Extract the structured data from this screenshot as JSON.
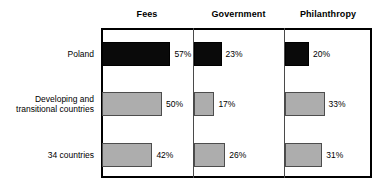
{
  "chart_data": {
    "type": "bar",
    "title": "",
    "subtitle": "",
    "xlabel": "",
    "ylabel": "",
    "orientation": "horizontal",
    "grid": false,
    "legend": "none",
    "panel_layout": "three side-by-side panels sharing row categories",
    "value_suffix": "%",
    "xlim": [
      0,
      60
    ],
    "panels": [
      "Fees",
      "Government",
      "Philanthropy"
    ],
    "categories": [
      "Poland",
      "Developing and transitional countries",
      "34 countries"
    ],
    "series": [
      {
        "name": "Fees",
        "values": [
          57,
          50,
          42
        ]
      },
      {
        "name": "Government",
        "values": [
          23,
          17,
          26
        ]
      },
      {
        "name": "Philanthropy",
        "values": [
          20,
          33,
          31
        ]
      }
    ],
    "bar_colors": {
      "Poland": "#0a0a0a",
      "Developing and transitional countries": "#adadad",
      "34 countries": "#adadad"
    }
  },
  "headers": [
    {
      "label": "Fees"
    },
    {
      "label": "Government"
    },
    {
      "label": "Philanthropy"
    }
  ],
  "rows": [
    {
      "label": "Poland"
    },
    {
      "label": "Developing and\ntransitional countries"
    },
    {
      "label": "34 countries"
    }
  ],
  "cells": {
    "fees": [
      {
        "value_label": "57%"
      },
      {
        "value_label": "50%"
      },
      {
        "value_label": "42%"
      }
    ],
    "government": [
      {
        "value_label": "23%"
      },
      {
        "value_label": "17%"
      },
      {
        "value_label": "26%"
      }
    ],
    "philanthropy": [
      {
        "value_label": "20%"
      },
      {
        "value_label": "33%"
      },
      {
        "value_label": "31%"
      }
    ]
  },
  "colors": {
    "bar_dark": "#0a0a0a",
    "bar_light": "#adadad",
    "bar_light_border": "#4d4d4d",
    "frame": "#000000",
    "divider": "#4a4a4a",
    "background": "#ffffff",
    "text": "#000000"
  }
}
